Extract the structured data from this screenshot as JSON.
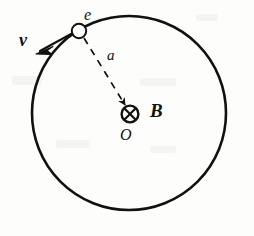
{
  "figure": {
    "canvas": {
      "width": 254,
      "height": 236,
      "background": "#fdfdfc"
    },
    "stroke_color": "#111111",
    "orbit": {
      "name": "orbit-circle",
      "center_x": 129,
      "center_y": 113,
      "radius": 97,
      "stroke_width": 2.6,
      "dashed": false
    },
    "electron": {
      "name": "electron-marker",
      "label": "e",
      "center_x": 79,
      "center_y": 31,
      "radius": 7,
      "stroke_width": 2.0
    },
    "velocity": {
      "name": "velocity-vector",
      "label": "v",
      "from_x": 81,
      "from_y": 29,
      "to_x": 37,
      "to_y": 53,
      "stroke_width": 2.0,
      "arrow": "open-barbed"
    },
    "radius_line": {
      "name": "radius-dashed-line",
      "label": "a",
      "from_x": 84,
      "from_y": 38,
      "to_x": 126,
      "to_y": 106,
      "stroke_width": 1.7,
      "dash_pattern": "7 6",
      "arrow": "solid-triangle"
    },
    "field": {
      "name": "magnetic-field-into-page",
      "label": "B",
      "center_label": "O",
      "center_x": 130,
      "center_y": 114,
      "radius": 8.5,
      "stroke_width": 2.4,
      "symbol": "circle-with-cross"
    },
    "labels": [
      {
        "name": "electron-label",
        "text": "e",
        "style": "italic",
        "x": 84,
        "y": 7
      },
      {
        "name": "radius-label",
        "text": "a",
        "style": "italic",
        "x": 107,
        "y": 48
      },
      {
        "name": "velocity-label",
        "text": "v",
        "style": "bold-italic",
        "x": 19,
        "y": 31
      },
      {
        "name": "magnetic-field-label",
        "text": "B",
        "style": "bold-italic",
        "x": 150,
        "y": 101
      },
      {
        "name": "centre-label",
        "text": "O",
        "style": "italic",
        "x": 120,
        "y": 127
      }
    ]
  }
}
